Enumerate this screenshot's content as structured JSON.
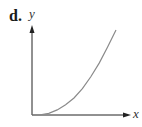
{
  "figure": {
    "panel_label": "d.",
    "x_axis_label": "x",
    "y_axis_label": "y",
    "axis_color": "#222222",
    "curve_color": "#8a8a8a",
    "curve_shape": "concave-up increasing, flat at origin"
  },
  "chart_data": {
    "type": "line",
    "title": "d.",
    "xlabel": "x",
    "ylabel": "y",
    "series": [
      {
        "name": "curve",
        "x": [
          0,
          0.1,
          0.2,
          0.3,
          0.4,
          0.5,
          0.6,
          0.7,
          0.8,
          0.9,
          1.0
        ],
        "y": [
          0,
          0.003,
          0.02,
          0.06,
          0.12,
          0.2,
          0.31,
          0.45,
          0.61,
          0.8,
          1.0
        ]
      }
    ],
    "xlim": [
      0,
      1.15
    ],
    "ylim": [
      0,
      1.05
    ],
    "grid": false,
    "ticks": false
  }
}
